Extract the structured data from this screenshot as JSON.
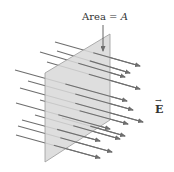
{
  "diagram": {
    "area_label": {
      "prefix": "Area = ",
      "symbol": "A"
    },
    "field_label": {
      "symbol": "E",
      "vector_mark": "→"
    },
    "colors": {
      "plane_fill": "#d8d8d8",
      "plane_edge": "#9a9a9a",
      "arrow": "#6e6e6e",
      "text": "#333333"
    },
    "plane": {
      "points": [
        [
          110,
          34
        ],
        [
          45,
          73
        ],
        [
          45,
          162
        ],
        [
          110,
          120
        ]
      ]
    },
    "field_lines": [
      {
        "x1": 55,
        "y1": 42,
        "x2": 140,
        "y2": 66
      },
      {
        "x1": 57,
        "y1": 51,
        "x2": 130,
        "y2": 73
      },
      {
        "x1": 40,
        "y1": 52,
        "x2": 125,
        "y2": 77
      },
      {
        "x1": 47,
        "y1": 62,
        "x2": 140,
        "y2": 89
      },
      {
        "x1": 15,
        "y1": 70,
        "x2": 127,
        "y2": 101
      },
      {
        "x1": 28,
        "y1": 81,
        "x2": 133,
        "y2": 110
      },
      {
        "x1": 20,
        "y1": 88,
        "x2": 143,
        "y2": 122
      },
      {
        "x1": 40,
        "y1": 100,
        "x2": 128,
        "y2": 124
      },
      {
        "x1": 16,
        "y1": 103,
        "x2": 110,
        "y2": 129
      },
      {
        "x1": 35,
        "y1": 115,
        "x2": 120,
        "y2": 139
      },
      {
        "x1": 22,
        "y1": 120,
        "x2": 100,
        "y2": 141
      },
      {
        "x1": 18,
        "y1": 126,
        "x2": 112,
        "y2": 152
      },
      {
        "x1": 16,
        "y1": 135,
        "x2": 100,
        "y2": 158
      },
      {
        "x1": 62,
        "y1": 118,
        "x2": 125,
        "y2": 136
      }
    ]
  }
}
